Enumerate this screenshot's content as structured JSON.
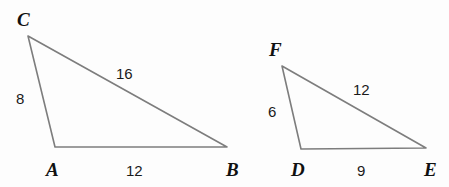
{
  "figure": {
    "background_color": "#fdfdfd",
    "line_color": "#7d7d7d",
    "text_color": "#111111"
  },
  "triangles": [
    {
      "name": "triangle-abc",
      "vertices": [
        {
          "name": "C",
          "label": "C",
          "x": 28,
          "y": 36,
          "label_x": 17,
          "label_y": 26
        },
        {
          "name": "A",
          "label": "A",
          "x": 55,
          "y": 147,
          "label_x": 46,
          "label_y": 176
        },
        {
          "name": "B",
          "label": "B",
          "x": 227,
          "y": 147,
          "label_x": 226,
          "label_y": 176
        }
      ],
      "sides": [
        {
          "name": "side-ca",
          "label": "8",
          "label_x": 16,
          "label_y": 104
        },
        {
          "name": "side-cb",
          "label": "16",
          "label_x": 116,
          "label_y": 79
        },
        {
          "name": "side-ab",
          "label": "12",
          "label_x": 126,
          "label_y": 176
        }
      ]
    },
    {
      "name": "triangle-def",
      "vertices": [
        {
          "name": "F",
          "label": "F",
          "x": 282,
          "y": 66,
          "label_x": 269,
          "label_y": 56
        },
        {
          "name": "D",
          "label": "D",
          "x": 301,
          "y": 149,
          "label_x": 291,
          "label_y": 176
        },
        {
          "name": "E",
          "label": "E",
          "x": 426,
          "y": 148,
          "label_x": 424,
          "label_y": 176
        }
      ],
      "sides": [
        {
          "name": "side-fd",
          "label": "6",
          "label_x": 268,
          "label_y": 117
        },
        {
          "name": "side-fe",
          "label": "12",
          "label_x": 353,
          "label_y": 95
        },
        {
          "name": "side-de",
          "label": "9",
          "label_x": 357,
          "label_y": 176
        }
      ]
    }
  ]
}
